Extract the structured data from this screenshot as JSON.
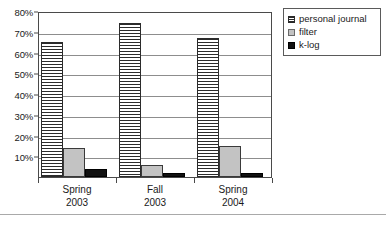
{
  "chart_data": {
    "type": "bar",
    "title": "",
    "xlabel": "",
    "ylabel": "",
    "categories": [
      "Spring\n2003",
      "Fall\n2003",
      "Spring\n2004"
    ],
    "category_lines": [
      {
        "line1": "Spring",
        "line2": "2003"
      },
      {
        "line1": "Fall",
        "line2": "2003"
      },
      {
        "line1": "Spring",
        "line2": "2004"
      }
    ],
    "series": [
      {
        "name": "personal journal",
        "values": [
          65,
          74,
          67
        ],
        "color": "#ffffff",
        "pattern": "horizontal-hatch"
      },
      {
        "name": "filter",
        "values": [
          14,
          6,
          15
        ],
        "color": "#c3c3c3",
        "pattern": "solid"
      },
      {
        "name": "k-log",
        "values": [
          4,
          2,
          2
        ],
        "color": "#111111",
        "pattern": "solid"
      }
    ],
    "ylim": [
      0,
      80
    ],
    "yticks": [
      10,
      20,
      30,
      40,
      50,
      60,
      70,
      80
    ],
    "ytick_labels": [
      "10%",
      "20%",
      "30%",
      "40%",
      "50%",
      "60%",
      "70%",
      "80%"
    ],
    "grid": true,
    "grid_axis": "y",
    "legend_position": "top-right"
  },
  "legend": {
    "entries": [
      {
        "label": "personal journal",
        "swatch": "hatched-swatch-icon"
      },
      {
        "label": "filter",
        "swatch": "gray-swatch-icon"
      },
      {
        "label": "k-log",
        "swatch": "black-swatch-icon"
      }
    ]
  },
  "colors": {
    "journal": "#ffffff",
    "filter": "#c3c3c3",
    "klog": "#111111",
    "grid": "#8d8d8d",
    "axis": "#4a4a4a",
    "text": "#1a1a1a"
  }
}
